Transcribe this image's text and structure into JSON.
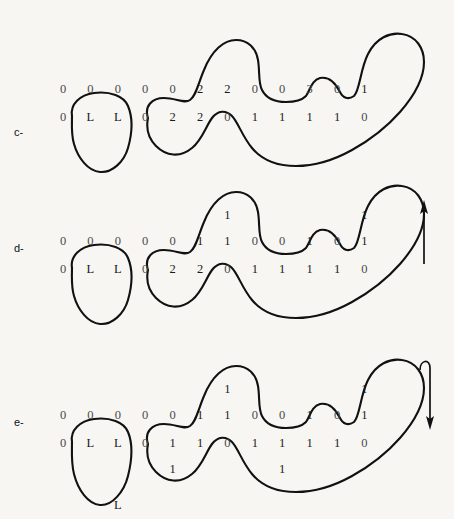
{
  "figure": {
    "background_color": "#f7f6f3",
    "ink_color": "#111111",
    "panels": [
      {
        "label": "c-",
        "id": "panel-c",
        "top_row": [
          "0",
          "0",
          "0",
          "0",
          "0",
          "2",
          "2",
          "0",
          "0",
          "3",
          "0",
          "1"
        ],
        "bottom_row": [
          "0",
          "L",
          "L",
          "0",
          "2",
          "2",
          "0",
          "1",
          "1",
          "1",
          "1",
          "0"
        ],
        "extra_digits": [],
        "arrow": null
      },
      {
        "label": "d-",
        "id": "panel-d",
        "top_row": [
          "0",
          "0",
          "0",
          "0",
          "0",
          "1",
          "1",
          "0",
          "0",
          "1",
          "0",
          "1"
        ],
        "bottom_row": [
          "0",
          "L",
          "L",
          "0",
          "2",
          "2",
          "0",
          "1",
          "1",
          "1",
          "1",
          "0"
        ],
        "extra_digits": [
          {
            "value": "1",
            "column": 6,
            "position": "above"
          },
          {
            "value": "1",
            "column": 11,
            "position": "above"
          }
        ],
        "arrow": "up-arrow-icon"
      },
      {
        "label": "e-",
        "id": "panel-e",
        "top_row": [
          "0",
          "0",
          "0",
          "0",
          "0",
          "1",
          "1",
          "0",
          "0",
          "1",
          "0",
          "1"
        ],
        "bottom_row": [
          "0",
          "L",
          "L",
          "0",
          "1",
          "1",
          "0",
          "1",
          "1",
          "1",
          "1",
          "0"
        ],
        "extra_digits": [
          {
            "value": "1",
            "column": 6,
            "position": "above"
          },
          {
            "value": "1",
            "column": 11,
            "position": "above"
          },
          {
            "value": "1",
            "column": 4,
            "position": "below"
          },
          {
            "value": "1",
            "column": 8,
            "position": "below"
          },
          {
            "value": "L",
            "column": 2,
            "position": "blob-bottom"
          }
        ],
        "arrow": "hooked-down-arrow-icon"
      }
    ],
    "arrows": [
      {
        "name": "up-arrow-icon",
        "direction": "up"
      },
      {
        "name": "hooked-down-arrow-icon",
        "direction": "down-hooked"
      }
    ]
  }
}
